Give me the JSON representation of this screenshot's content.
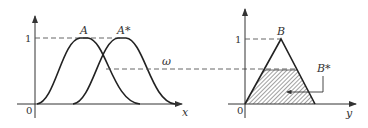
{
  "figure": {
    "left_panel": {
      "x_axis_label": "x",
      "origin_label": "0",
      "y_tick_label": "1",
      "curve_A_label": "A",
      "curve_A_star_label": "A*",
      "match_degree_label": "ω"
    },
    "right_panel": {
      "y_axis_label": "y",
      "origin_label": "0",
      "y_tick_label": "1",
      "triangle_B_label": "B",
      "result_B_star_label": "B*"
    },
    "colors": {
      "line": "#222222",
      "dash": "#555555",
      "hatch": "#444444",
      "background": "#ffffff"
    }
  }
}
